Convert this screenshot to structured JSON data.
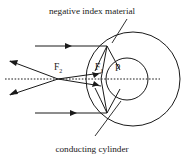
{
  "figure": {
    "background_color": "#ffffff",
    "ink_color": "#1a1a1a",
    "width": 185,
    "height": 160
  },
  "labels": {
    "top_caption": "negative index material",
    "bottom_caption": "conducting cylinder",
    "focus_outer_main": "F",
    "focus_outer_sub": "2",
    "focus_inner_main": "F",
    "focus_inner_sub": "1",
    "point_p": "P"
  },
  "geometry": {
    "outer_circle": {
      "cx": 133,
      "cy": 79,
      "r": 47,
      "name": "negative-index-material-shell"
    },
    "inner_circle": {
      "cx": 127,
      "cy": 79,
      "r": 21,
      "name": "conducting-cylinder"
    },
    "optical_axis": {
      "x1": 5,
      "y1": 79,
      "x2": 160,
      "y2": 79,
      "style": "dotted"
    },
    "focus_outer": {
      "x": 58,
      "y": 79
    },
    "focus_inner": {
      "x": 101,
      "y": 79
    },
    "point_p_marker": {
      "x": 118,
      "y": 72
    }
  },
  "rays": {
    "incoming": [
      {
        "name": "incoming-ray-upper",
        "x1": 35,
        "y1": 46,
        "x2": 105,
        "y2": 46,
        "arrow_at": 0.6
      },
      {
        "name": "incoming-ray-lower",
        "x1": 35,
        "y1": 113,
        "x2": 105,
        "y2": 113,
        "arrow_at": 0.6
      }
    ],
    "outgoing": [
      {
        "name": "outgoing-ray-upper",
        "x1": 101,
        "y1": 73,
        "x2": 9,
        "y2": 61
      },
      {
        "name": "outgoing-ray-lower",
        "x1": 101,
        "y1": 86,
        "x2": 9,
        "y2": 95
      }
    ]
  },
  "leaders": [
    {
      "name": "leader-negative-index-material",
      "x1": 126,
      "y1": 20,
      "x2": 113,
      "y2": 42
    },
    {
      "name": "leader-conducting-cylinder",
      "x1": 96,
      "y1": 135,
      "x2": 120,
      "y2": 102
    }
  ]
}
